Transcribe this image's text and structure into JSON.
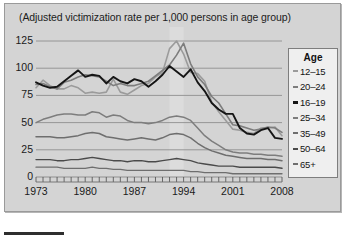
{
  "figure": {
    "background_color": "#ffffff",
    "panel_color": "#d4d4d4",
    "panel_border_color": "#9a9a9a"
  },
  "chart_data": {
    "type": "line",
    "title": "(Adjusted victimization rate per 1,000 persons in age group)",
    "xlabel": "",
    "ylabel": "",
    "xlim": [
      1973,
      2008
    ],
    "ylim": [
      0,
      125
    ],
    "yticks": [
      0,
      25,
      50,
      75,
      100,
      125
    ],
    "ytick_labels": [
      "0",
      "25",
      "50",
      "75",
      "100",
      "125"
    ],
    "xticks": [
      1973,
      1980,
      1987,
      1994,
      2001,
      2008
    ],
    "xtick_labels": [
      "1973",
      "1980",
      "1987",
      "1994",
      "2001",
      "2008"
    ],
    "minor_xtick_interval": 1,
    "grid": "horizontal",
    "grid_color": "#8f8f8f",
    "legend": {
      "title": "Age",
      "position": "right-outside",
      "entries": [
        "12-15",
        "20-24",
        "16-19",
        "25-34",
        "35-49",
        "50-64",
        "65+"
      ]
    },
    "x": [
      1973,
      1974,
      1975,
      1976,
      1977,
      1978,
      1979,
      1980,
      1981,
      1982,
      1983,
      1984,
      1985,
      1986,
      1987,
      1988,
      1989,
      1990,
      1991,
      1992,
      1993,
      1994,
      1995,
      1996,
      1997,
      1998,
      1999,
      2000,
      2001,
      2002,
      2003,
      2004,
      2005,
      2006,
      2007,
      2008
    ],
    "series": [
      {
        "name": "12-15",
        "color": "#9b9b9b",
        "width": 1.6,
        "values": [
          82,
          89,
          84,
          81,
          81,
          84,
          82,
          77,
          78,
          77,
          78,
          90,
          78,
          76,
          80,
          84,
          86,
          92,
          96,
          118,
          125,
          113,
          96,
          95,
          88,
          69,
          60,
          52,
          44,
          43,
          41,
          40,
          45,
          45,
          46,
          38
        ]
      },
      {
        "name": "20-24",
        "color": "#7d7d7d",
        "width": 1.6,
        "values": [
          85,
          86,
          83,
          81,
          87,
          89,
          92,
          94,
          93,
          92,
          88,
          84,
          86,
          84,
          84,
          86,
          88,
          93,
          98,
          103,
          112,
          123,
          104,
          92,
          85,
          74,
          68,
          58,
          48,
          47,
          45,
          43,
          44,
          46,
          45,
          41
        ]
      },
      {
        "name": "16-19",
        "color": "#151515",
        "width": 1.9,
        "values": [
          87,
          84,
          82,
          83,
          88,
          93,
          98,
          92,
          94,
          93,
          86,
          92,
          88,
          86,
          90,
          88,
          83,
          88,
          94,
          102,
          97,
          92,
          99,
          87,
          79,
          68,
          62,
          58,
          58,
          45,
          40,
          39,
          43,
          45,
          36,
          35
        ]
      },
      {
        "name": "25-34",
        "color": "#7d7d7d",
        "width": 1.5,
        "values": [
          50,
          53,
          55,
          57,
          58,
          58,
          57,
          57,
          60,
          59,
          55,
          57,
          56,
          52,
          50,
          50,
          49,
          50,
          52,
          55,
          56,
          55,
          52,
          45,
          38,
          33,
          29,
          25,
          23,
          22,
          22,
          21,
          21,
          20,
          20,
          19
        ]
      },
      {
        "name": "35-49",
        "color": "#6e6e6e",
        "width": 1.5,
        "values": [
          37,
          37,
          37,
          36,
          36,
          37,
          38,
          40,
          41,
          40,
          37,
          36,
          35,
          34,
          35,
          36,
          35,
          34,
          36,
          39,
          40,
          39,
          36,
          31,
          27,
          24,
          22,
          20,
          19,
          18,
          17,
          17,
          17,
          16,
          16,
          15
        ]
      },
      {
        "name": "50-64",
        "color": "#4a4a4a",
        "width": 1.4,
        "values": [
          16,
          16,
          16,
          15,
          15,
          16,
          16,
          17,
          18,
          17,
          16,
          15,
          15,
          14,
          15,
          15,
          14,
          14,
          15,
          16,
          17,
          16,
          15,
          13,
          12,
          11,
          10,
          10,
          10,
          9,
          9,
          9,
          9,
          9,
          9,
          8
        ]
      },
      {
        "name": "65+",
        "color": "#6e6e6e",
        "width": 1.3,
        "values": [
          9,
          9,
          9,
          9,
          8,
          8,
          8,
          8,
          9,
          8,
          8,
          7,
          7,
          6,
          6,
          6,
          6,
          6,
          6,
          6,
          6,
          6,
          5,
          5,
          4,
          4,
          4,
          4,
          3,
          3,
          3,
          3,
          3,
          3,
          3,
          3
        ]
      }
    ],
    "highlight_band": {
      "from": 1992,
      "to": 1994,
      "color": "#dcdcdc"
    }
  },
  "caption": {
    "text": "",
    "rule_color": "#2e2e2e"
  }
}
